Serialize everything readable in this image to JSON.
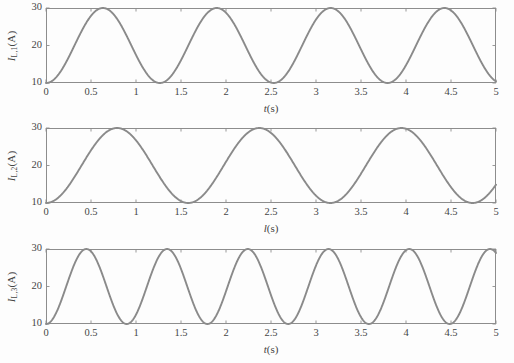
{
  "figure": {
    "background_color": "#fdfdfd",
    "axis_color": "#8d8d8d",
    "curve_color": "#8a8a8a",
    "text_color": "#454545"
  },
  "chart_data": [
    {
      "type": "line",
      "title": "",
      "xlabel": "t(s)",
      "ylabel": "I_L,1(A)",
      "ylabel_symbol": "I",
      "ylabel_subscript": "L,1",
      "ylabel_unit": "(A)",
      "xlabel_var": "t",
      "xlabel_unit": "(s)",
      "xlim": [
        0,
        5
      ],
      "ylim": [
        10,
        30
      ],
      "xticks": [
        0,
        0.5,
        1,
        1.5,
        2,
        2.5,
        3,
        3.5,
        4,
        4.5,
        5
      ],
      "xticklabels": [
        "0",
        "0.5",
        "1",
        "1.5",
        "2",
        "2.5",
        "3",
        "3.5",
        "4",
        "4.5",
        "5"
      ],
      "yticks": [
        10,
        20,
        30
      ],
      "yticklabels": [
        "10",
        "20",
        "30"
      ],
      "grid": false,
      "legend": null,
      "waveform": {
        "shape": "sinusoid",
        "amplitude": 10,
        "offset": 20,
        "period": 1.265,
        "phase_deg": 0,
        "start_value": 20,
        "peaks_t": [
          0.316,
          1.581,
          2.846,
          4.111
        ],
        "troughs_t": [
          0.949,
          2.214,
          3.479,
          4.744
        ],
        "peak_value": 30,
        "trough_value": 10,
        "end_value": 19.0
      }
    },
    {
      "type": "line",
      "title": "",
      "xlabel": "l(s)",
      "ylabel": "I_L,2(A)",
      "ylabel_symbol": "I",
      "ylabel_subscript": "L,2",
      "ylabel_unit": "(A)",
      "xlabel_var": "l",
      "xlabel_unit": "(s)",
      "xlim": [
        0,
        5
      ],
      "ylim": [
        10,
        30
      ],
      "xticks": [
        0,
        0.5,
        1,
        1.5,
        2,
        2.5,
        3,
        3.5,
        4,
        4.5,
        5
      ],
      "xticklabels": [
        "0",
        "0.5",
        "1",
        "1.5",
        "2",
        "2.5",
        "3",
        "3.5",
        "4",
        "4.5",
        "5"
      ],
      "yticks": [
        10,
        20,
        30
      ],
      "yticklabels": [
        "10",
        "20",
        "30"
      ],
      "grid": false,
      "legend": null,
      "waveform": {
        "shape": "sinusoid",
        "amplitude": 10,
        "offset": 20,
        "period": 1.58,
        "phase_deg": 0,
        "start_value": 20,
        "peaks_t": [
          0.395,
          1.975,
          3.555
        ],
        "troughs_t": [
          1.185,
          2.765,
          4.345
        ],
        "peak_value": 30,
        "trough_value": 10,
        "end_value": 29.6
      }
    },
    {
      "type": "line",
      "title": "",
      "xlabel": "t(s)",
      "ylabel": "I_L,3(A)",
      "ylabel_symbol": "I",
      "ylabel_subscript": "L,3",
      "ylabel_unit": "(A)",
      "xlabel_var": "t",
      "xlabel_unit": "(s)",
      "xlim": [
        0,
        5
      ],
      "ylim": [
        10,
        30
      ],
      "xticks": [
        0,
        0.5,
        1,
        1.5,
        2,
        2.5,
        3,
        3.5,
        4,
        4.5,
        5
      ],
      "xticklabels": [
        "0",
        "0.5",
        "1",
        "1.5",
        "2",
        "2.5",
        "3",
        "3.5",
        "4",
        "4.5",
        "5"
      ],
      "yticks": [
        10,
        20,
        30
      ],
      "yticklabels": [
        "10",
        "20",
        "30"
      ],
      "grid": false,
      "legend": null,
      "waveform": {
        "shape": "sinusoid",
        "amplitude": 10,
        "offset": 20,
        "period": 0.897,
        "phase_deg": 0,
        "start_value": 20,
        "peaks_t": [
          0.224,
          1.121,
          2.018,
          2.915,
          3.812,
          4.709
        ],
        "troughs_t": [
          0.673,
          1.57,
          2.467,
          3.364,
          4.261
        ],
        "peak_value": 30,
        "trough_value": 10,
        "end_value": 16.5
      }
    }
  ]
}
